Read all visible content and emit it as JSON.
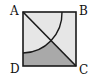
{
  "diagram": {
    "type": "geometry",
    "shape": "square ABCD with diagonal AC and quarter-circle arc centered at A",
    "vertices": {
      "A": {
        "label": "A",
        "position": "top-left"
      },
      "B": {
        "label": "B",
        "position": "top-right"
      },
      "C": {
        "label": "C",
        "position": "bottom-right"
      },
      "D": {
        "label": "D",
        "position": "bottom-left"
      }
    },
    "segments": [
      "AB",
      "BC",
      "CD",
      "DA",
      "AC"
    ],
    "arc": {
      "center": "A",
      "from_side": "AB",
      "to_side": "AD"
    },
    "shaded_region": "region of triangle ACD outside the arc",
    "colors": {
      "square_fill": "#e6e6e6",
      "shaded_fill": "#a9a9a9",
      "stroke": "#1a1a1a",
      "background": "#ffffff"
    }
  }
}
